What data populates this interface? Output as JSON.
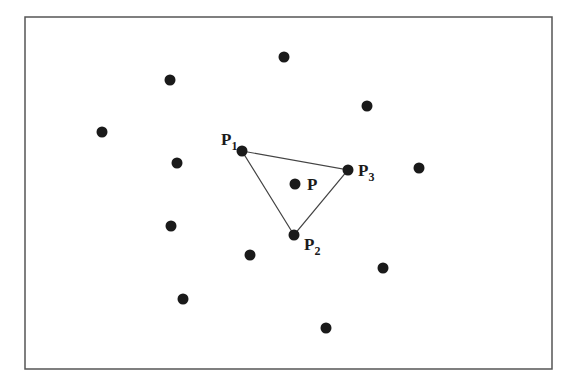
{
  "diagram": {
    "type": "point-triangle",
    "frame": {
      "x": 25,
      "y": 17,
      "width": 527,
      "height": 352,
      "stroke": "#555555"
    },
    "colors": {
      "point": "#1a1a1a",
      "edge": "#444444",
      "text": "#1a1a1a"
    },
    "point_radius": 5.5,
    "points": [
      {
        "x": 284,
        "y": 57
      },
      {
        "x": 170,
        "y": 80
      },
      {
        "x": 367,
        "y": 106
      },
      {
        "x": 102,
        "y": 132
      },
      {
        "x": 177,
        "y": 163
      },
      {
        "x": 419,
        "y": 168
      },
      {
        "x": 171,
        "y": 226
      },
      {
        "x": 250,
        "y": 255
      },
      {
        "x": 383,
        "y": 268
      },
      {
        "x": 183,
        "y": 299
      },
      {
        "x": 326,
        "y": 328
      }
    ],
    "labeled_points": {
      "P1": {
        "x": 242,
        "y": 151,
        "label": "P",
        "subscript": "1",
        "lx": 221,
        "ly": 145
      },
      "P2": {
        "x": 294,
        "y": 235,
        "label": "P",
        "subscript": "2",
        "lx": 304,
        "ly": 250
      },
      "P3": {
        "x": 348,
        "y": 170,
        "label": "P",
        "subscript": "3",
        "lx": 358,
        "ly": 176
      },
      "P": {
        "x": 295,
        "y": 184,
        "label": "P",
        "subscript": "",
        "lx": 307,
        "ly": 190
      }
    },
    "triangle": [
      "P1",
      "P3",
      "P2"
    ]
  }
}
